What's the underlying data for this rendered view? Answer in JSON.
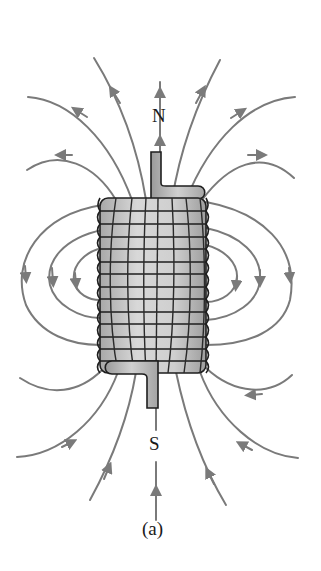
{
  "figure": {
    "type": "solenoid-magnetic-field",
    "caption": "(a)",
    "north_label": "N",
    "south_label": "S",
    "colors": {
      "field_line": "#7a7a7a",
      "coil_fill": "#c4c4c4",
      "coil_outline": "#1e1e1e",
      "text": "#1a1a1a",
      "background": "#ffffff"
    },
    "coil": {
      "turns": 14,
      "x": 100,
      "y": 198,
      "width": 106,
      "height": 175
    }
  }
}
